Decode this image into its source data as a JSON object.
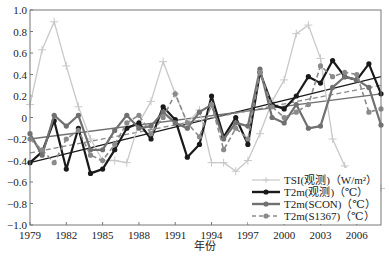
{
  "chart_data": {
    "type": "line",
    "title": "",
    "xlabel": "年份",
    "ylabel": "",
    "xlim": [
      1979,
      2008
    ],
    "ylim": [
      -1.0,
      1.0
    ],
    "xticks": [
      "1979",
      "1982",
      "1985",
      "1988",
      "1991",
      "1994",
      "1997",
      "2000",
      "2003",
      "2006"
    ],
    "yticks": [
      "1.0",
      "0.8",
      "0.6",
      "0.4",
      "0.2",
      "0",
      "-0.2",
      "-0.4",
      "-0.6",
      "-0.8",
      "-1.0"
    ],
    "grid": false,
    "legend_position": "lower right",
    "x": [
      1979,
      1980,
      1981,
      1982,
      1983,
      1984,
      1985,
      1986,
      1987,
      1988,
      1989,
      1990,
      1991,
      1992,
      1993,
      1994,
      1995,
      1996,
      1997,
      1998,
      1999,
      2000,
      2001,
      2002,
      2003,
      2004,
      2005,
      2006,
      2007,
      2008
    ],
    "series": [
      {
        "name": "TSI(观测)（W/m²）",
        "color": "#c8c8c8",
        "marker": "plus",
        "style": "solid",
        "values": [
          0.12,
          0.63,
          0.89,
          0.48,
          0.1,
          -0.2,
          -0.4,
          -0.4,
          -0.42,
          -0.05,
          0.15,
          0.52,
          0.22,
          -0.05,
          0.07,
          -0.42,
          -0.42,
          -0.5,
          -0.4,
          -0.15,
          0.15,
          0.35,
          0.78,
          0.86,
          0.55,
          -0.2,
          -0.45,
          -0.58,
          -0.72,
          -0.66
        ]
      },
      {
        "name": "T2m(观测)（℃）",
        "color": "#1a1a1a",
        "marker": "circle",
        "style": "solid",
        "values": [
          -0.42,
          -0.32,
          -0.03,
          -0.48,
          -0.1,
          -0.52,
          -0.48,
          -0.3,
          -0.1,
          -0.05,
          -0.2,
          0.1,
          -0.02,
          -0.37,
          -0.25,
          0.2,
          -0.18,
          0.0,
          -0.25,
          0.42,
          0.12,
          0.08,
          0.2,
          0.38,
          0.32,
          0.53,
          0.38,
          0.35,
          0.5,
          0.22
        ]
      },
      {
        "name": "T2m(SCON)（℃）",
        "color": "#707070",
        "marker": "circle",
        "style": "solid",
        "values": [
          -0.15,
          -0.35,
          0.02,
          -0.08,
          0.02,
          -0.3,
          -0.3,
          -0.12,
          0.02,
          -0.1,
          -0.08,
          0.05,
          -0.05,
          -0.1,
          0.05,
          0.12,
          -0.2,
          -0.05,
          -0.08,
          0.45,
          0.0,
          -0.05,
          0.12,
          -0.1,
          -0.08,
          0.28,
          0.38,
          0.35,
          0.28,
          -0.07
        ]
      },
      {
        "name": "T2m(S1367)（℃）",
        "color": "#8a8a8a",
        "marker": "circle",
        "style": "dashed",
        "values": [
          -0.2,
          -0.3,
          -0.42,
          -0.2,
          -0.12,
          -0.35,
          -0.4,
          -0.25,
          -0.05,
          0.02,
          -0.15,
          0.0,
          0.22,
          -0.05,
          -0.18,
          0.12,
          -0.3,
          -0.1,
          -0.2,
          0.42,
          0.1,
          0.0,
          0.05,
          0.12,
          0.48,
          0.38,
          0.42,
          0.4,
          0.05,
          0.08
        ]
      }
    ],
    "trend_lines": [
      {
        "name": "T2m(观测) trend",
        "color": "#1a1a1a",
        "style": "solid",
        "start": [
          1979,
          -0.42
        ],
        "end": [
          2008,
          0.38
        ]
      },
      {
        "name": "T2m(SCON) trend",
        "color": "#707070",
        "style": "solid",
        "start": [
          1979,
          -0.2
        ],
        "end": [
          2008,
          0.22
        ]
      },
      {
        "name": "T2m(S1367) trend",
        "color": "#8a8a8a",
        "style": "dashed",
        "start": [
          1979,
          -0.33
        ],
        "end": [
          2008,
          0.3
        ]
      }
    ]
  },
  "legend": {
    "items": [
      {
        "label": "TSI(观测)（W/m²）"
      },
      {
        "label": "T2m(观测)（℃）"
      },
      {
        "label": "T2m(SCON)（℃）"
      },
      {
        "label": "T2m(S1367)（℃）"
      }
    ]
  },
  "axes": {
    "xlabel": "年份"
  }
}
